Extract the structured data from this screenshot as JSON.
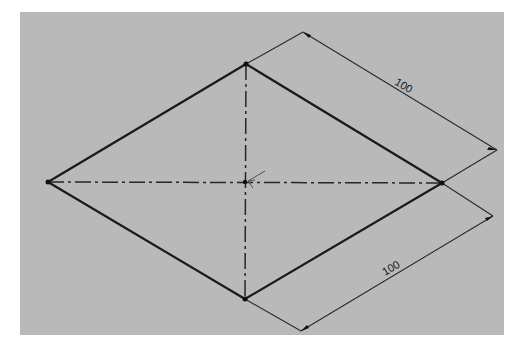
{
  "figure": {
    "type": "technical-sketch",
    "colors": {
      "background": "#ffffff",
      "panel": "#b9b9b9",
      "lines": "#1a1a1a"
    },
    "vertices": {
      "left": [
        48,
        182
      ],
      "top": [
        246,
        64
      ],
      "right": [
        442,
        183
      ],
      "bottom": [
        245,
        299
      ],
      "center": [
        245,
        182
      ]
    },
    "dimensions": [
      {
        "id": "upper-right-edge",
        "value": "100",
        "from": "top",
        "to": "right"
      },
      {
        "id": "lower-right-edge",
        "value": "100",
        "from": "right",
        "to": "bottom"
      }
    ]
  }
}
